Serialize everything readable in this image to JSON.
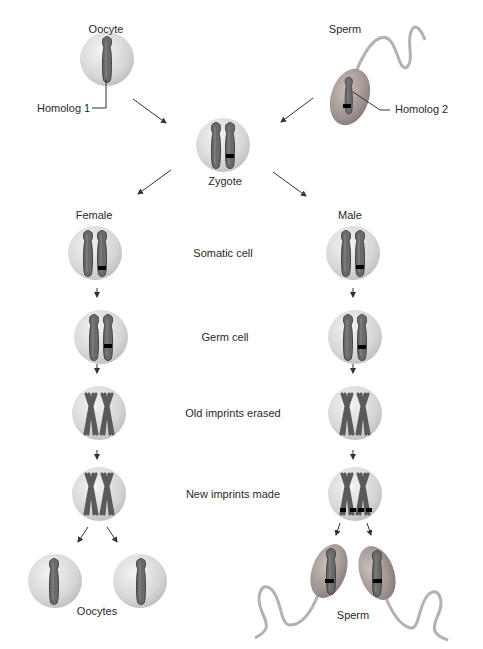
{
  "top": {
    "oocyte_label": "Oocyte",
    "sperm_label": "Sperm",
    "homolog1_label": "Homolog 1",
    "homolog2_label": "Homolog 2",
    "zygote_label": "Zygote"
  },
  "lineages": {
    "female_label": "Female",
    "male_label": "Male"
  },
  "stages": [
    {
      "label": "Somatic cell"
    },
    {
      "label": "Germ cell"
    },
    {
      "label": "Old imprints erased"
    },
    {
      "label": "New imprints made"
    }
  ],
  "bottom": {
    "oocytes_label": "Oocytes",
    "sperm_label": "Sperm"
  },
  "colors": {
    "cell_fill": "#d9d9d9",
    "cell_highlight": "#f2f2f2",
    "chromosome": "#555555",
    "imprint_mark": "#000000",
    "sperm_head": "#9a8f8c",
    "arrow": "#333333"
  }
}
